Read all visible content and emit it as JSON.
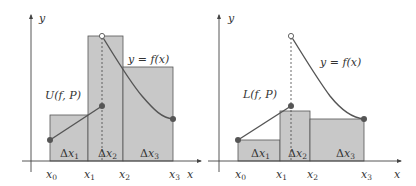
{
  "colors": {
    "rect_fill": "#c8c8c8",
    "rect_stroke": "#555555",
    "curve": "#555555",
    "point": "#555555",
    "axis": "#444444",
    "background": "#ffffff"
  },
  "panels": [
    {
      "name": "upper-sum",
      "sum_label": "U(f, P)",
      "curve_label": "y = f(x)",
      "axis_x_label": "x",
      "axis_y_label": "y",
      "ticks": [
        "x0",
        "x1",
        "x2",
        "x3"
      ],
      "intervals": [
        "Δx1",
        "Δx2",
        "Δx3"
      ],
      "rectangle_heights": "maximum of f on each subinterval"
    },
    {
      "name": "lower-sum",
      "sum_label": "L(f, P)",
      "curve_label": "y = f(x)",
      "axis_x_label": "x",
      "axis_y_label": "y",
      "ticks": [
        "x0",
        "x1",
        "x2",
        "x3"
      ],
      "intervals": [
        "Δx1",
        "Δx2",
        "Δx3"
      ],
      "rectangle_heights": "minimum of f on each subinterval"
    }
  ],
  "text": {
    "left": {
      "y": "y",
      "x": "x",
      "sum_U": "U(",
      "sum_fP": "f",
      "sum_rest": ", P)",
      "curve": "y = f(x)"
    },
    "right": {
      "y": "y",
      "x": "x",
      "sum_L": "L(",
      "sum_fP": "f",
      "sum_rest": ", P)",
      "curve": "y = f(x)"
    }
  }
}
